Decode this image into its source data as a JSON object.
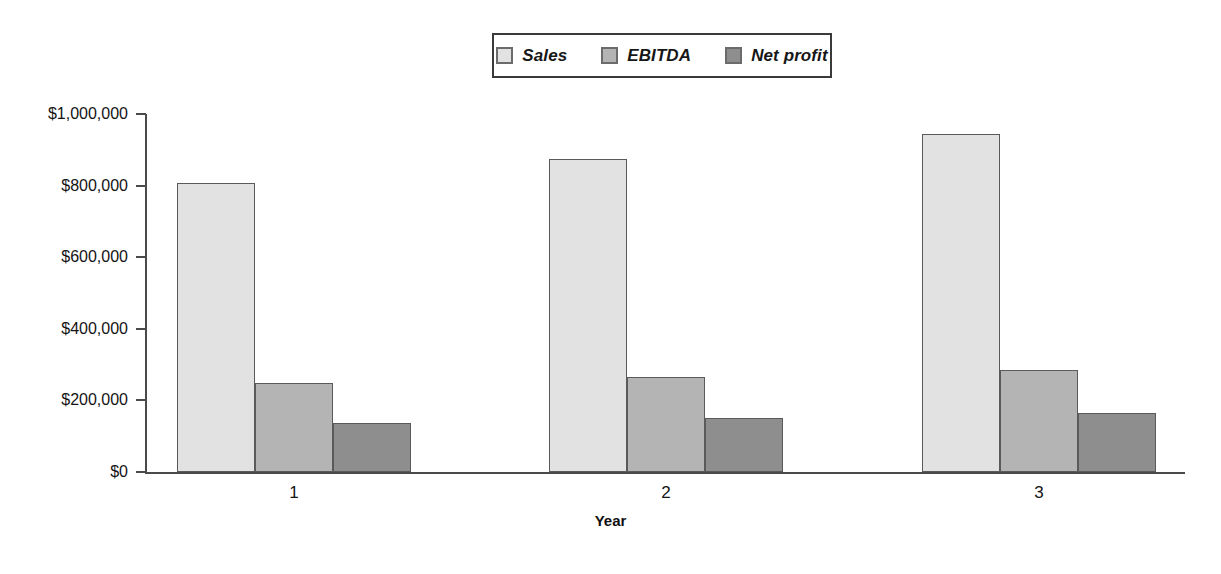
{
  "chart_data": {
    "type": "bar",
    "title": "",
    "xlabel": "Year",
    "ylabel": "",
    "categories": [
      "1",
      "2",
      "3"
    ],
    "series": [
      {
        "name": "Sales",
        "values": [
          807000,
          874000,
          944000
        ],
        "color": "#e2e2e2"
      },
      {
        "name": "EBITDA",
        "values": [
          248000,
          266000,
          284000
        ],
        "color": "#b4b4b4"
      },
      {
        "name": "Net profit",
        "values": [
          138000,
          150000,
          166000
        ],
        "color": "#8e8e8e"
      }
    ],
    "ylim": [
      0,
      1000000
    ],
    "ytick_values": [
      0,
      200000,
      400000,
      600000,
      800000,
      1000000
    ],
    "ytick_labels": [
      "$0",
      "$200,000",
      "$400,000",
      "$600,000",
      "$800,000",
      "$1,000,000"
    ],
    "grid": false,
    "legend_position": "top-center",
    "legend_italic": true
  },
  "legend": {
    "items": [
      {
        "label": "Sales",
        "swatch": "legend-swatch-sales"
      },
      {
        "label": "EBITDA",
        "swatch": "legend-swatch-ebitda"
      },
      {
        "label": "Net profit",
        "swatch": "legend-swatch-net-profit"
      }
    ]
  },
  "axes": {
    "x_title": "Year"
  }
}
